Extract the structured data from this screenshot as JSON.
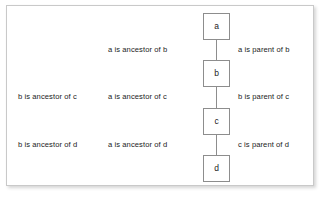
{
  "figure": {
    "frame_border_color": "#c9c9c9",
    "node_border_color": "#8d8d8d",
    "text_color": "#1b1b1b",
    "background": "#ffffff"
  },
  "nodes": [
    {
      "id": "a",
      "label": "a"
    },
    {
      "id": "b",
      "label": "b"
    },
    {
      "id": "c",
      "label": "c"
    },
    {
      "id": "d",
      "label": "d"
    }
  ],
  "edges": [
    {
      "from": "a",
      "to": "b"
    },
    {
      "from": "b",
      "to": "c"
    },
    {
      "from": "c",
      "to": "d"
    }
  ],
  "labels": {
    "row_ab": {
      "left": "",
      "middle": "a is ancestor of b",
      "right": "a is parent of b"
    },
    "row_bc": {
      "left": "b is ancestor of c",
      "middle": "a is ancestor of c",
      "right": "b is parent of c"
    },
    "row_cd": {
      "left": "b is ancestor of d",
      "middle": "a is ancestor of d",
      "right": "c is parent of d"
    }
  }
}
